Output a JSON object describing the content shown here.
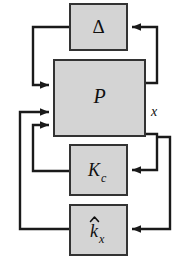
{
  "figure": {
    "kind": "control-block-diagram",
    "width": 190,
    "height": 261,
    "background_color": "#ffffff"
  },
  "style": {
    "block_fill": "#d4d4d4",
    "block_border_color": "#333333",
    "block_border_width": 2,
    "line_color": "#1a1a1a",
    "line_width": 2.4,
    "text_color": "#101010"
  },
  "blocks": [
    {
      "id": "delta",
      "label": "Δ",
      "name": "uncertainty-block-delta",
      "x": 70,
      "y": 4,
      "w": 57,
      "h": 46,
      "font_size": 19,
      "subscript": "",
      "hat": false
    },
    {
      "id": "plant",
      "label": "P",
      "name": "plant-block-p",
      "x": 54,
      "y": 60,
      "w": 91,
      "h": 76,
      "font_size": 20,
      "subscript": "",
      "hat": false
    },
    {
      "id": "kc",
      "label": "K",
      "name": "controller-block-kc",
      "x": 70,
      "y": 145,
      "w": 57,
      "h": 50,
      "font_size": 18,
      "subscript": "c",
      "hat": false
    },
    {
      "id": "khat",
      "label": "k",
      "name": "adaptive-gain-block-k-hat-x",
      "x": 70,
      "y": 205,
      "w": 57,
      "h": 50,
      "font_size": 18,
      "subscript": "x",
      "hat": true
    }
  ],
  "signals": [
    {
      "id": "x",
      "label": "x",
      "name": "signal-label-x",
      "x": 154,
      "y": 113,
      "font_size": 14
    }
  ],
  "connections": [
    {
      "id": "p-to-delta",
      "name": "connection-plant-to-delta",
      "from": "plant",
      "to": "delta",
      "description": "plant right output routes up the right side into delta right input"
    },
    {
      "id": "delta-to-p",
      "name": "connection-delta-to-plant",
      "from": "delta",
      "to": "plant",
      "description": "delta left output routes down the left side into plant first input"
    },
    {
      "id": "x-to-kc",
      "name": "connection-x-to-kc",
      "from": "plant",
      "to": "kc",
      "description": "plant output x routes down right side into Kc right input"
    },
    {
      "id": "x-to-khat",
      "name": "connection-x-to-k-hat-x",
      "from": "plant",
      "to": "khat",
      "description": "plant output x routes down the outer right side into k-hat-x right input"
    },
    {
      "id": "kc-to-p",
      "name": "connection-kc-to-plant",
      "from": "kc",
      "to": "plant",
      "description": "Kc left output routes up the inner left side into plant third input"
    },
    {
      "id": "khat-to-p",
      "name": "connection-k-hat-x-to-plant",
      "from": "khat",
      "to": "plant",
      "description": "k-hat-x left output routes up the outer left side into plant second input"
    }
  ]
}
